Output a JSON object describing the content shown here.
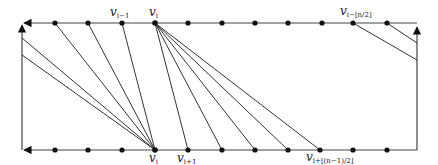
{
  "diagram": {
    "type": "graph-drawing",
    "frame": {
      "left_x": 22,
      "right_x": 417,
      "top_y": 23,
      "bottom_y": 150,
      "stroke": "#444444"
    },
    "top_vertices_x": [
      55,
      88,
      122,
      155,
      188,
      222,
      255,
      288,
      322,
      353,
      387
    ],
    "bottom_vertices_x": [
      55,
      88,
      122,
      155,
      188,
      222,
      255,
      288,
      320,
      353,
      387
    ],
    "left_side_points_y": [
      38,
      55
    ],
    "right_side_points_y": [
      43,
      60
    ],
    "labels": {
      "top_v_i_minus_1": {
        "base": "v",
        "sub": "i−1",
        "x": 122
      },
      "top_v_i": {
        "base": "v",
        "sub": "i",
        "x": 155
      },
      "top_v_i_minus_half_n": {
        "base": "v",
        "sub": "i−⌊n/2⌋",
        "x": 353
      },
      "bottom_v_i": {
        "base": "v",
        "sub": "i",
        "x": 155
      },
      "bottom_v_i_plus_1": {
        "base": "v",
        "sub": "i+1",
        "x": 188
      },
      "bottom_v_i_plus_half_n_minus_1": {
        "base": "v",
        "sub": "i+⌊(n−1)/2⌋",
        "x": 320
      }
    },
    "edges": [
      {
        "from": "left(22,38)",
        "to": "bottom v_i(155,150)"
      },
      {
        "from": "left(22,55)",
        "to": "bottom v_i(155,150)"
      },
      {
        "from": "top(55,23)",
        "to": "bottom v_i(155,150)"
      },
      {
        "from": "top(88,23)",
        "to": "bottom v_i(155,150)"
      },
      {
        "from": "top(122,23)",
        "to": "bottom v_i(155,150)"
      },
      {
        "from": "top v_i(155,23)",
        "to": "bottom(188,150)"
      },
      {
        "from": "top v_i(155,23)",
        "to": "bottom(222,150)"
      },
      {
        "from": "top v_i(155,23)",
        "to": "bottom(255,150)"
      },
      {
        "from": "top v_i(155,23)",
        "to": "bottom(288,150)"
      },
      {
        "from": "top v_i(155,23)",
        "to": "bottom(320,150)"
      },
      {
        "from": "top(353,23)",
        "to": "right(417,60)"
      },
      {
        "from": "top(387,23)",
        "to": "right(417,43)"
      }
    ]
  }
}
